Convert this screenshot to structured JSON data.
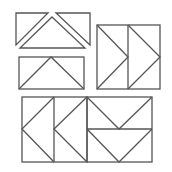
{
  "figure": {
    "title": "",
    "stroke_color": "#555555",
    "background": "#ffffff",
    "groups": [
      {
        "name": "top-triangles",
        "pieces": 3
      },
      {
        "name": "wide-rectangle-with-triangle",
        "pieces": 3
      },
      {
        "name": "right-arrows-square",
        "pieces": 6
      },
      {
        "name": "left-arrows-square",
        "pieces": 6
      },
      {
        "name": "down-arrows-square",
        "pieces": 6
      }
    ]
  }
}
